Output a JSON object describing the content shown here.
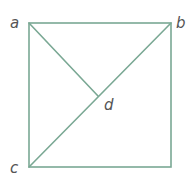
{
  "diagram": {
    "stroke_color": "#7aa894",
    "label_color": "#555555",
    "points": {
      "a": {
        "label": "a",
        "x": 29,
        "y": 23
      },
      "b": {
        "label": "b",
        "x": 171,
        "y": 23
      },
      "c": {
        "label": "c",
        "x": 29,
        "y": 167
      },
      "d": {
        "label": "d",
        "x": 98,
        "y": 96
      }
    },
    "labels": {
      "a": "a",
      "b": "b",
      "c": "c",
      "d": "d"
    }
  }
}
